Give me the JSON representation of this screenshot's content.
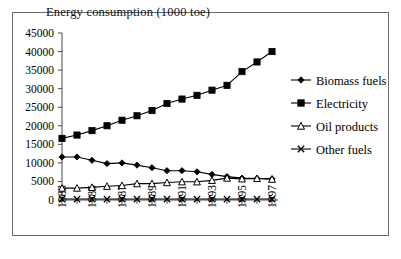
{
  "figure": {
    "caption": ""
  },
  "chart_data": {
    "type": "line",
    "title": "Energy consumption (1000 toe)",
    "xlabel": "",
    "ylabel": "",
    "ylim": [
      0,
      45000
    ],
    "ytick_step": 5000,
    "yticks": [
      0,
      5000,
      10000,
      15000,
      20000,
      25000,
      30000,
      35000,
      40000,
      45000
    ],
    "ytick_labels": [
      "0",
      "5000",
      "10000",
      "15000",
      "20000",
      "25000",
      "30000",
      "35000",
      "40000",
      "45000"
    ],
    "x": [
      1983,
      1984,
      1985,
      1986,
      1987,
      1988,
      1989,
      1990,
      1991,
      1992,
      1993,
      1994,
      1995,
      1996,
      1997
    ],
    "xtick_labels": [
      "1983",
      "",
      "1985",
      "",
      "1987",
      "",
      "1989",
      "",
      "1991",
      "",
      "1993",
      "",
      "1995",
      "",
      "1997"
    ],
    "xtick_labels_visible": [
      "1983",
      "1985",
      "1987",
      "1989",
      "1991",
      "1993",
      "1995",
      "1997"
    ],
    "xtick_rotation": 90,
    "grid": false,
    "legend_position": "right",
    "series": [
      {
        "name": "Biomass fuels",
        "marker": "diamond-filled",
        "values": [
          11600,
          11600,
          10700,
          9800,
          10000,
          9400,
          8700,
          7900,
          7900,
          7600,
          6900,
          6300,
          5900,
          5800,
          5700
        ]
      },
      {
        "name": "Electricity",
        "marker": "square-filled",
        "values": [
          16600,
          17500,
          18700,
          20000,
          21500,
          22700,
          24100,
          26000,
          27200,
          28200,
          29600,
          30900,
          34600,
          37200,
          40000
        ]
      },
      {
        "name": "Oil products",
        "marker": "triangle-hollow",
        "values": [
          3200,
          3200,
          3400,
          3700,
          3900,
          4400,
          4400,
          4700,
          4900,
          4900,
          5300,
          5900,
          5700,
          5800,
          5600
        ]
      },
      {
        "name": "Other fuels",
        "marker": "cross",
        "values": [
          250,
          250,
          250,
          250,
          250,
          250,
          250,
          250,
          250,
          250,
          250,
          250,
          250,
          250,
          250
        ]
      }
    ]
  },
  "legend": {
    "items": [
      {
        "label": "Biomass fuels",
        "marker": "diamond-filled"
      },
      {
        "label": "Electricity",
        "marker": "square-filled"
      },
      {
        "label": "Oil products",
        "marker": "triangle-hollow"
      },
      {
        "label": "Other fuels",
        "marker": "cross"
      }
    ]
  }
}
